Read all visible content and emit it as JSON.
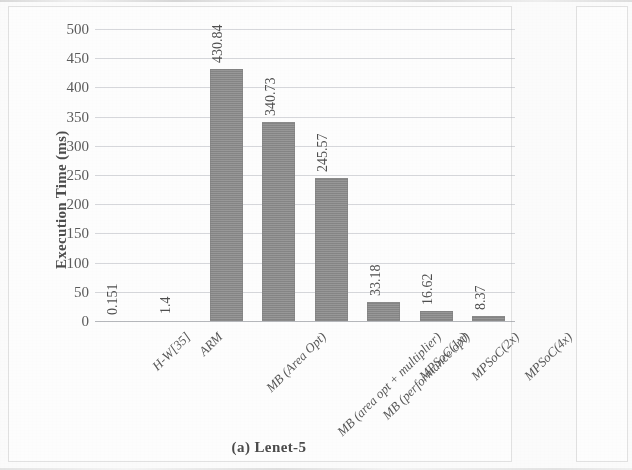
{
  "figure": {
    "caption": "(a) Lenet-5"
  },
  "panel_a": {
    "y_axis_title": "Execution Time (ms)"
  },
  "panel_b": {
    "y_axis_title": "Execution Time (ms)"
  },
  "chart_data": {
    "type": "bar",
    "title": "(a) Lenet-5",
    "xlabel": "",
    "ylabel": "Execution Time (ms)",
    "ylim": [
      0,
      500
    ],
    "ytick_step": 50,
    "yticks": [
      500,
      450,
      400,
      350,
      300,
      250,
      200,
      150,
      100,
      50,
      0
    ],
    "grid": true,
    "legend": null,
    "bar_color": "#8b8b8b",
    "categories": [
      "H-W[35]",
      "ARM",
      "MB (Area Opt)",
      "MB (area opt + multiplier)",
      "MB (performance opt)",
      "MPSoC(1x)",
      "MPSoC(2x)",
      "MPSoC(4x)"
    ],
    "values": [
      0.151,
      1.4,
      430.84,
      340.73,
      245.57,
      33.18,
      16.62,
      8.37
    ],
    "data_labels": [
      "0.151",
      "1.4",
      "430.84",
      "340.73",
      "245.57",
      "33.18",
      "16.62",
      "8.37"
    ]
  }
}
